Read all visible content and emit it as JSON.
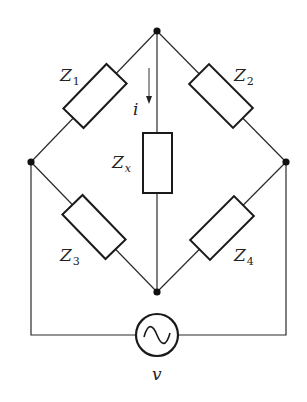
{
  "diagram": {
    "type": "Wheatstone-style impedance bridge circuit",
    "components": [
      {
        "id": "Z1",
        "label_main": "Z",
        "label_sub": "1",
        "position": "upper-left branch"
      },
      {
        "id": "Z2",
        "label_main": "Z",
        "label_sub": "2",
        "position": "upper-right branch"
      },
      {
        "id": "Z3",
        "label_main": "Z",
        "label_sub": "3",
        "position": "lower-left branch"
      },
      {
        "id": "Z4",
        "label_main": "Z",
        "label_sub": "4",
        "position": "lower-right branch"
      },
      {
        "id": "Zx",
        "label_main": "Z",
        "label_sub": "x",
        "position": "center vertical branch"
      }
    ],
    "current": {
      "label": "i",
      "direction": "down"
    },
    "source": {
      "label": "v",
      "symbol": "ac-sine-wave"
    },
    "nodes": [
      "top",
      "left",
      "right",
      "bottom"
    ]
  }
}
